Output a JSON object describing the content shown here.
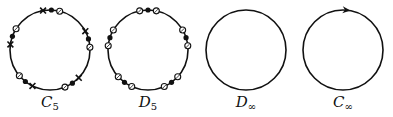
{
  "figure": {
    "colors": {
      "stroke": "#111111",
      "background": "#ffffff"
    },
    "panels": [
      {
        "id": "C5",
        "label_main": "C",
        "label_sub": "5",
        "cx": 50,
        "cy": 50,
        "r": 40,
        "description": "circle with 5-fold rotational pattern of markers: cross, filled dot, open circle",
        "sector_pattern": [
          {
            "marker": "cross",
            "offset_deg": 0
          },
          {
            "marker": "dot",
            "offset_deg": 12
          },
          {
            "marker": "ring",
            "offset_deg": 24
          }
        ],
        "start_deg": -100,
        "repeat": 5
      },
      {
        "id": "D5",
        "label_main": "D",
        "label_sub": "5",
        "cx": 148,
        "cy": 50,
        "r": 40,
        "description": "circle with 5-fold dihedral pattern: ring, dot, ring",
        "sector_pattern": [
          {
            "marker": "ring",
            "offset_deg": -12
          },
          {
            "marker": "dot",
            "offset_deg": 0
          },
          {
            "marker": "ring",
            "offset_deg": 12
          }
        ],
        "start_deg": -90,
        "repeat": 5
      },
      {
        "id": "Dinf",
        "label_main": "D",
        "label_sub": "∞",
        "cx": 246,
        "cy": 50,
        "r": 40,
        "description": "plain circle"
      },
      {
        "id": "Cinf",
        "label_main": "C",
        "label_sub": "∞",
        "cx": 343,
        "cy": 50,
        "r": 40,
        "description": "circle with clockwise arrowhead at top",
        "arrow_deg": -85
      }
    ]
  }
}
